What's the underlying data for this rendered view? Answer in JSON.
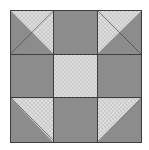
{
  "figure": {
    "block_name": "Shoo Fly Variation",
    "grid_rows": 3,
    "grid_columns": 3,
    "background_color": "#ffffff",
    "border_color": "#3d3d3d",
    "solid_fabric_color": "#8c8c8c",
    "check_fabric_color_light": "#dcdcdc",
    "check_fabric_color_dark": "#cccccc",
    "check_cell_size_px": 2
  },
  "cells": [
    {
      "id": "cell-top-left",
      "position": "top-left",
      "row": 1,
      "column": 1,
      "type": "half-square-triangle",
      "solid_half": "lower-left",
      "check_half": "upper-right",
      "seam_direction": "bottom-left-to-top-right"
    },
    {
      "id": "cell-top-center",
      "position": "top-center",
      "row": 1,
      "column": 2,
      "type": "solid",
      "fabric": "solid-gray"
    },
    {
      "id": "cell-top-right",
      "position": "top-right",
      "row": 1,
      "column": 3,
      "type": "half-square-triangle",
      "solid_half": "lower-right",
      "check_half": "upper-left",
      "seam_direction": "top-left-to-bottom-right"
    },
    {
      "id": "cell-middle-left",
      "position": "middle-left",
      "row": 2,
      "column": 1,
      "type": "solid",
      "fabric": "solid-gray"
    },
    {
      "id": "cell-center",
      "position": "center",
      "row": 2,
      "column": 2,
      "type": "solid",
      "fabric": "checkered"
    },
    {
      "id": "cell-middle-right",
      "position": "middle-right",
      "row": 2,
      "column": 3,
      "type": "solid",
      "fabric": "solid-gray"
    },
    {
      "id": "cell-bottom-left",
      "position": "bottom-left",
      "row": 3,
      "column": 1,
      "type": "half-square-triangle",
      "solid_half": "lower-left",
      "check_half": "upper-right",
      "seam_direction": "top-left-to-bottom-right"
    },
    {
      "id": "cell-bottom-center",
      "position": "bottom-center",
      "row": 3,
      "column": 2,
      "type": "solid",
      "fabric": "solid-gray"
    },
    {
      "id": "cell-bottom-right",
      "position": "bottom-right",
      "row": 3,
      "column": 3,
      "type": "half-square-triangle",
      "solid_half": "lower-right",
      "check_half": "upper-left",
      "seam_direction": "bottom-left-to-top-right"
    }
  ]
}
